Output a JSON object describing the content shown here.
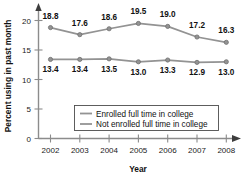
{
  "chart_data": {
    "type": "line",
    "title": "",
    "xlabel": "Year",
    "ylabel": "Percent using in past month",
    "categories": [
      "2002",
      "2003",
      "2004",
      "2005",
      "2006",
      "2007",
      "2008"
    ],
    "x": [
      2002,
      2003,
      2004,
      2005,
      2006,
      2007,
      2008
    ],
    "xlim": [
      2002,
      2008
    ],
    "ylim": [
      0,
      21
    ],
    "yticks": [
      0,
      5,
      10,
      15,
      20
    ],
    "ytick_labels": [
      "0",
      "5",
      "10",
      "15",
      "20"
    ],
    "grid": false,
    "legend_position": "inside-lower-center",
    "series": [
      {
        "name": "Enrolled full time in college",
        "values": [
          18.8,
          17.6,
          18.6,
          19.5,
          19.0,
          17.2,
          16.3
        ],
        "labels": [
          "18.8",
          "17.6",
          "18.6",
          "19.5",
          "19.0",
          "17.2",
          "16.3"
        ],
        "color": "#939393",
        "marker": "circle"
      },
      {
        "name": "Not enrolled full time in college",
        "values": [
          13.4,
          13.4,
          13.5,
          13.0,
          13.3,
          12.9,
          13.0
        ],
        "labels": [
          "13.4",
          "13.4",
          "13.5",
          "13.0",
          "13.3",
          "12.9",
          "13.0"
        ],
        "color": "#939393",
        "marker": "circle"
      }
    ]
  },
  "legend": {
    "items": [
      {
        "label": "Enrolled full time in college"
      },
      {
        "label": "Not enrolled full time in college"
      }
    ]
  },
  "axes": {
    "x_title": "Year",
    "y_title": "Percent using in past month",
    "x_tick_labels": [
      "2002",
      "2003",
      "2004",
      "2005",
      "2006",
      "2007",
      "2008"
    ],
    "y_tick_labels": [
      "20",
      "15",
      "10",
      "5",
      "0"
    ]
  },
  "colors": {
    "series": "#939393",
    "axis": "#8c8c8c",
    "text": "#111111",
    "legend_border": "#4d4d4d",
    "background": "#ffffff"
  }
}
